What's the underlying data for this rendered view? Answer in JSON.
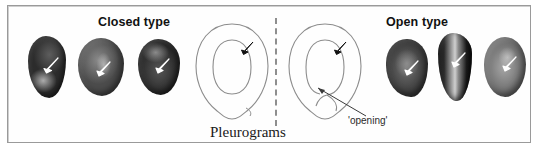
{
  "figure": {
    "headings": {
      "closed": "Closed type",
      "open": "Open type"
    },
    "caption": "Pleurograms",
    "annotations": {
      "opening": "'opening'"
    },
    "colors": {
      "frame_border": "#9a9a9a",
      "divider": "#8e8e8e",
      "diagram_stroke": "#8c8c8c",
      "arrow_white": "#ffffff",
      "arrow_black": "#111111",
      "text": "#111111",
      "background": "#ffffff"
    },
    "groups": [
      {
        "name": "closed-type",
        "label": "Closed type",
        "seed_count": 3,
        "pleurogram": {
          "type": "closed",
          "description": "seed outline with continuous closed inner pleurogram line",
          "arrow_color": "#111111",
          "has_opening": false
        },
        "seeds": [
          {
            "id": "seed-c1",
            "arrow": "white",
            "tone": "very-dark"
          },
          {
            "id": "seed-c2",
            "arrow": "white",
            "tone": "mid-gray"
          },
          {
            "id": "seed-c3",
            "arrow": "white",
            "tone": "dark"
          }
        ]
      },
      {
        "name": "open-type",
        "label": "Open type",
        "seed_count": 3,
        "pleurogram": {
          "type": "open",
          "description": "seed outline with inner pleurogram line interrupted by an opening at base",
          "arrow_color": "#111111",
          "has_opening": true,
          "opening_label": "'opening'"
        },
        "seeds": [
          {
            "id": "seed-o1",
            "arrow": "white",
            "tone": "mid-dark"
          },
          {
            "id": "seed-o2",
            "arrow": "white",
            "tone": "very-dark-striped"
          },
          {
            "id": "seed-o3",
            "arrow": "white",
            "tone": "light-gray"
          }
        ]
      }
    ],
    "divider": {
      "style": "dashed",
      "orientation": "vertical"
    }
  }
}
